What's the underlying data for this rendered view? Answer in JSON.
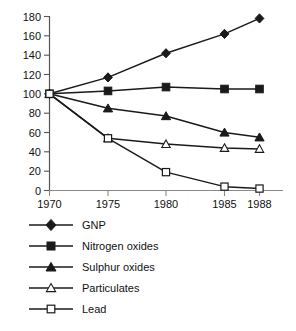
{
  "chart_data": {
    "type": "line",
    "title": "",
    "subtitle": "",
    "xlabel": "",
    "ylabel": "",
    "x": [
      "1970",
      "1975",
      "1980",
      "1985",
      "1988"
    ],
    "categories": [
      "1970",
      "1975",
      "1980",
      "1985",
      "1988"
    ],
    "xtick_labels": [
      "1970",
      "1975",
      "1980",
      "1985",
      "1988"
    ],
    "ytick_labels": [
      "0",
      "20",
      "40",
      "60",
      "80",
      "100",
      "120",
      "140",
      "160",
      "180"
    ],
    "ylim": [
      0,
      180
    ],
    "grid": false,
    "legend_position": "below",
    "series": [
      {
        "name": "GNP",
        "marker": "filled-diamond",
        "values": [
          100,
          117,
          142,
          162,
          178
        ]
      },
      {
        "name": "Nitrogen oxides",
        "marker": "filled-square",
        "values": [
          100,
          103,
          107,
          105,
          105
        ]
      },
      {
        "name": "Sulphur oxides",
        "marker": "filled-triangle",
        "values": [
          100,
          85,
          77,
          60,
          55
        ]
      },
      {
        "name": "Particulates",
        "marker": "open-triangle",
        "values": [
          100,
          54,
          48,
          44,
          43
        ]
      },
      {
        "name": "Lead",
        "marker": "open-square",
        "values": [
          100,
          54,
          19,
          4,
          2
        ]
      }
    ]
  },
  "legend": {
    "items": [
      {
        "label": "GNP",
        "marker": "filled-diamond"
      },
      {
        "label": "Nitrogen oxides",
        "marker": "filled-square"
      },
      {
        "label": "Sulphur oxides",
        "marker": "filled-triangle"
      },
      {
        "label": "Particulates",
        "marker": "open-triangle"
      },
      {
        "label": "Lead",
        "marker": "open-square"
      }
    ]
  },
  "footer": {
    "fragment": ""
  },
  "colors": {
    "line": "#1a1a1a",
    "marker_fill": "#1a1a1a",
    "marker_open_fill": "#ffffff",
    "axis": "#555555",
    "text": "#111111",
    "background": "#ffffff"
  }
}
